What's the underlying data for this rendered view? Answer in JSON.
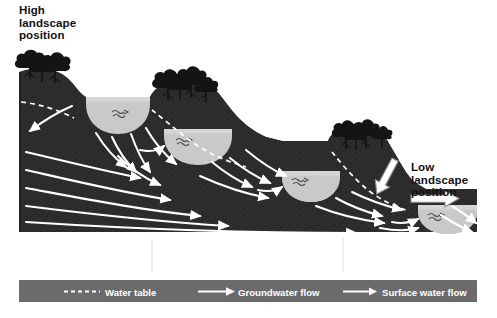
{
  "figure": {
    "colors": {
      "background": "#ffffff",
      "ground": "#2b2b2b",
      "ground_texture": "#3a3a3a",
      "lake_water": "#c9c9c9",
      "legend_bar": "#6b6b6b",
      "flow_arrow": "#ffffff",
      "water_table": "#ffffff",
      "surface_arrow_outline": "#9a9a9a",
      "text_dark": "#111111",
      "text_light": "#ffffff",
      "tree_canopy": "#141414"
    }
  },
  "annotations": {
    "high_position": "High\nlandscape\nposition",
    "low_position": "Low\nlandscape\nposition"
  },
  "categories": [
    {
      "id": "hydraulically-mounded-lakes",
      "label": "Hydraulically\nMounded Lakes"
    },
    {
      "id": "groundwater-flowthrough-lakes",
      "label": "Groundwater\nFlowthrough Lakes"
    },
    {
      "id": "drainage-lakes",
      "label": "Drainage\nLakes"
    }
  ],
  "legend": [
    {
      "id": "water-table",
      "label": "Water table",
      "symbol": "dashed-line"
    },
    {
      "id": "groundwater-flow",
      "label": "Groundwater flow",
      "symbol": "solid-arrow"
    },
    {
      "id": "surface-water-flow",
      "label": "Surface water flow",
      "symbol": "solid-arrow"
    }
  ],
  "lakes": [
    {
      "id": "lake-1",
      "type": "hydraulically-mounded",
      "terrace": 1
    },
    {
      "id": "lake-2",
      "type": "groundwater-flowthrough",
      "terrace": 2
    },
    {
      "id": "lake-3",
      "type": "groundwater-flowthrough",
      "terrace": 3
    },
    {
      "id": "lake-4",
      "type": "drainage",
      "terrace": 4
    }
  ],
  "tree_clusters": [
    {
      "id": "trees-hilltop-1",
      "terrace": 0
    },
    {
      "id": "trees-hilltop-2",
      "terrace": 1
    },
    {
      "id": "trees-hilltop-3",
      "terrace": 3
    }
  ]
}
